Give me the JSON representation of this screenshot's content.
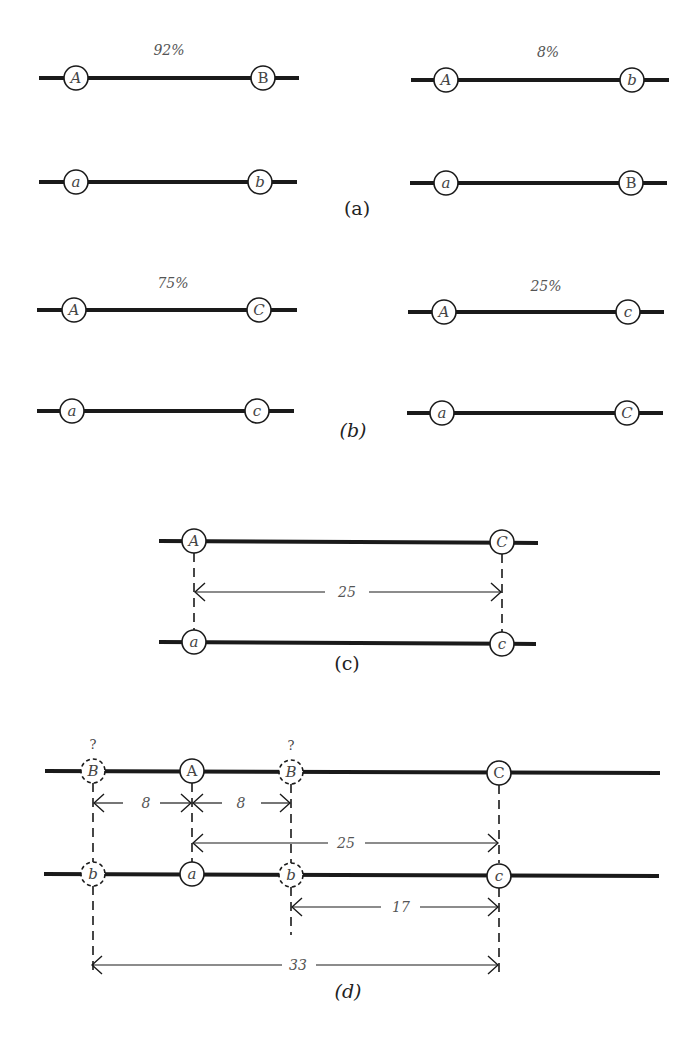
{
  "panels": {
    "a": {
      "label": "(a)",
      "left": {
        "frequency": "92%",
        "top": [
          "A",
          "B"
        ],
        "bottom": [
          "a",
          "b"
        ]
      },
      "right": {
        "frequency": "8%",
        "top": [
          "A",
          "b"
        ],
        "bottom": [
          "a",
          "B"
        ]
      }
    },
    "b": {
      "label": "(b)",
      "left": {
        "frequency": "75%",
        "top": [
          "A",
          "C"
        ],
        "bottom": [
          "a",
          "c"
        ]
      },
      "right": {
        "frequency": "25%",
        "top": [
          "A",
          "c"
        ],
        "bottom": [
          "a",
          "C"
        ]
      }
    },
    "c": {
      "label": "(c)",
      "top": [
        "A",
        "C"
      ],
      "bottom": [
        "a",
        "c"
      ],
      "distance_AC": "25"
    },
    "d": {
      "label": "(d)",
      "top": {
        "B_left": "B",
        "A": "A",
        "B_right": "B",
        "C": "C"
      },
      "bottom": {
        "b_left": "b",
        "a": "a",
        "b_right": "b",
        "c": "c"
      },
      "unknown_marker": "?",
      "distances": {
        "B_left_to_A": "8",
        "A_to_B_right": "8",
        "A_to_C": "25",
        "B_right_to_C": "17",
        "B_left_to_C": "33"
      }
    }
  }
}
